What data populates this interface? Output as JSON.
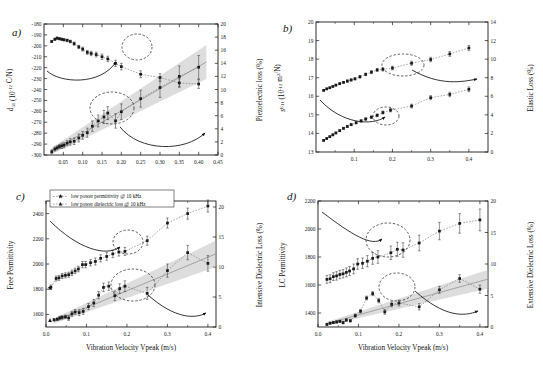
{
  "figure": {
    "background": "#ffffff",
    "foreground": "#1a1a1a",
    "band_color": "#b4b4b4",
    "fit_color": "#8a8a8a"
  },
  "panels": [
    {
      "id": "a",
      "label": "a)",
      "xlabel": "",
      "ylabel_left": "d31 (10-12 C/N)",
      "ylabel_right": "Piezoelectric loss (%)",
      "xticks": [
        "0.05",
        "0.10",
        "0.15",
        "0.20",
        "0.25",
        "0.30",
        "0.35",
        "0.40",
        "0.45"
      ],
      "yticks_left": [
        "-300",
        "-290",
        "-280",
        "-270",
        "-260",
        "-250",
        "-240",
        "-230",
        "-220",
        "-210",
        "-200",
        "-190",
        "-180"
      ],
      "yticks_right": [
        "0",
        "2",
        "4",
        "6",
        "8",
        "10",
        "12",
        "14",
        "16",
        "18",
        "20"
      ]
    },
    {
      "id": "b",
      "label": "b)",
      "xlabel": "",
      "ylabel_left": "sE11 (10-12 m2/N)",
      "ylabel_right": "Elastic Loss (%)",
      "xticks": [
        "0.1",
        "0.2",
        "0.3",
        "0.4"
      ],
      "yticks_left": [
        "13",
        "14",
        "15",
        "16",
        "17",
        "18",
        "19",
        "20"
      ],
      "yticks_right": [
        "0",
        "2",
        "4",
        "6",
        "8",
        "10",
        "12",
        "14"
      ]
    },
    {
      "id": "c",
      "label": "c)",
      "xlabel": "Vibration Velocity Vpeak (m/s)",
      "ylabel_left": "Free Permittivity",
      "ylabel_right": "Intensive Dielectric Loss (%)",
      "xticks": [
        "0.0",
        "0.1",
        "0.2",
        "0.3",
        "0.4"
      ],
      "yticks_left": [
        "1600",
        "1800",
        "2000",
        "2200",
        "2400"
      ],
      "yticks_right": [
        "0",
        "5",
        "10",
        "15",
        "20"
      ],
      "legend": [
        {
          "marker": "star",
          "text": "low power permittivity @ 10 kHz"
        },
        {
          "marker": "triangle",
          "text": "low power dielectric loss @ 10 kHz"
        }
      ]
    },
    {
      "id": "d",
      "label": "d)",
      "xlabel": "Vibration Velocity Vpeak (m/s)",
      "ylabel_left": "LC Permittivity",
      "ylabel_right": "Extensive Dielectric Loss (%)",
      "xticks": [
        "0.0",
        "0.1",
        "0.2",
        "0.3",
        "0.4"
      ],
      "yticks_left": [
        "1400",
        "1600",
        "1800",
        "2000",
        "2200"
      ],
      "yticks_right": [
        "0",
        "5",
        "10",
        "15",
        "20"
      ]
    }
  ],
  "chart_data": [
    {
      "type": "scatter",
      "panel": "a",
      "title": "",
      "xlabel": "Vibration Velocity Vpeak (m/s)",
      "ylabel": "d31 (10-12 C/N)",
      "ylabel_right": "Piezoelectric loss (%)",
      "xlim": [
        0.0,
        0.45
      ],
      "ylim": [
        -300,
        -180
      ],
      "ylim_right": [
        0,
        20
      ],
      "grid": false,
      "series": [
        {
          "name": "d31",
          "axis": "left",
          "marker": "square",
          "x": [
            0.02,
            0.028,
            0.034,
            0.04,
            0.046,
            0.052,
            0.06,
            0.068,
            0.078,
            0.09,
            0.1,
            0.112,
            0.122,
            0.135,
            0.15,
            0.165,
            0.185,
            0.2,
            0.25,
            0.3,
            0.35,
            0.4
          ],
          "y": [
            -196,
            -194,
            -193,
            -193.5,
            -194,
            -194.5,
            -195,
            -196,
            -198,
            -201,
            -203,
            -206,
            -207,
            -208,
            -210,
            -212,
            -216,
            -219,
            -226,
            -229,
            -234,
            -235
          ],
          "yerr": [
            1.0,
            1.0,
            1.0,
            1.0,
            1.0,
            1.0,
            1.2,
            1.2,
            1.5,
            1.5,
            1.8,
            1.8,
            2.0,
            2.2,
            2.5,
            2.5,
            2.8,
            3.0,
            3.2,
            3.5,
            3.8,
            4.0
          ]
        },
        {
          "name": "Piezoelectric loss",
          "axis": "right",
          "marker": "square",
          "x": [
            0.02,
            0.028,
            0.034,
            0.04,
            0.046,
            0.052,
            0.06,
            0.068,
            0.078,
            0.09,
            0.1,
            0.112,
            0.125,
            0.14,
            0.155,
            0.165,
            0.185,
            0.2,
            0.25,
            0.3,
            0.35,
            0.4
          ],
          "y": [
            0.5,
            0.9,
            1.1,
            1.3,
            1.4,
            1.5,
            1.8,
            2.0,
            2.1,
            2.6,
            3.0,
            3.4,
            4.4,
            5.2,
            5.8,
            6.4,
            5.2,
            6.6,
            8.6,
            10.3,
            12.0,
            13.4
          ],
          "yerr": [
            0.3,
            0.3,
            0.3,
            0.3,
            0.4,
            0.4,
            0.4,
            0.5,
            0.5,
            0.6,
            0.6,
            0.7,
            0.8,
            0.9,
            1.0,
            1.0,
            1.1,
            1.2,
            1.3,
            1.5,
            1.6,
            1.8
          ]
        }
      ],
      "fit_band": {
        "on": "right",
        "x": [
          0.02,
          0.42
        ],
        "y": [
          0.6,
          14.2
        ],
        "width": [
          0.5,
          2.6
        ]
      }
    },
    {
      "type": "scatter",
      "panel": "b",
      "title": "",
      "xlabel": "Vibration Velocity Vpeak (m/s)",
      "ylabel": "sE11 (10-12 m2/N)",
      "ylabel_right": "Elastic Loss (%)",
      "xlim": [
        0.0,
        0.45
      ],
      "ylim": [
        13,
        20
      ],
      "ylim_right": [
        0,
        14
      ],
      "grid": false,
      "series": [
        {
          "name": "sE11",
          "axis": "left",
          "marker": "square",
          "x": [
            0.02,
            0.028,
            0.036,
            0.044,
            0.052,
            0.062,
            0.072,
            0.082,
            0.092,
            0.102,
            0.115,
            0.13,
            0.145,
            0.16,
            0.175,
            0.2,
            0.25,
            0.3,
            0.35,
            0.4
          ],
          "y": [
            16.32,
            16.4,
            16.46,
            16.53,
            16.6,
            16.68,
            16.75,
            16.82,
            16.88,
            16.94,
            17.05,
            17.18,
            17.3,
            17.42,
            17.45,
            17.52,
            17.78,
            17.98,
            18.28,
            18.6
          ],
          "yerr": [
            0.04,
            0.04,
            0.04,
            0.04,
            0.05,
            0.05,
            0.05,
            0.06,
            0.06,
            0.06,
            0.07,
            0.07,
            0.08,
            0.08,
            0.09,
            0.1,
            0.11,
            0.12,
            0.13,
            0.14
          ]
        },
        {
          "name": "Elastic Loss",
          "axis": "right",
          "marker": "square",
          "x": [
            0.02,
            0.028,
            0.036,
            0.044,
            0.052,
            0.062,
            0.072,
            0.082,
            0.092,
            0.105,
            0.118,
            0.13,
            0.145,
            0.16,
            0.175,
            0.195,
            0.25,
            0.3,
            0.35,
            0.4
          ],
          "y": [
            1.25,
            1.45,
            1.65,
            1.85,
            2.05,
            2.3,
            2.55,
            2.75,
            2.95,
            3.15,
            3.35,
            3.55,
            3.75,
            3.95,
            4.25,
            4.5,
            4.95,
            5.85,
            6.2,
            6.75
          ],
          "yerr": [
            0.08,
            0.08,
            0.08,
            0.09,
            0.09,
            0.1,
            0.1,
            0.11,
            0.11,
            0.12,
            0.13,
            0.13,
            0.14,
            0.15,
            0.16,
            0.18,
            0.2,
            0.22,
            0.24,
            0.26
          ]
        }
      ]
    },
    {
      "type": "scatter",
      "panel": "c",
      "title": "",
      "xlabel": "Vibration Velocity Vpeak (m/s)",
      "ylabel": "Free Permittivity",
      "ylabel_right": "Intensive Dielectric Loss (%)",
      "xlim": [
        0.0,
        0.42
      ],
      "ylim": [
        1500,
        2500
      ],
      "ylim_right": [
        0,
        21
      ],
      "grid": false,
      "series": [
        {
          "name": "Free Permittivity",
          "axis": "left",
          "marker": "square",
          "x": [
            0.012,
            0.025,
            0.032,
            0.04,
            0.048,
            0.056,
            0.064,
            0.072,
            0.08,
            0.09,
            0.098,
            0.11,
            0.122,
            0.135,
            0.15,
            0.165,
            0.18,
            0.195,
            0.25,
            0.3,
            0.35,
            0.4
          ],
          "y": [
            1815,
            1885,
            1890,
            1905,
            1910,
            1915,
            1930,
            1945,
            1960,
            1995,
            1995,
            2010,
            2020,
            2045,
            2060,
            2080,
            2095,
            2100,
            2185,
            2325,
            2400,
            2460
          ],
          "yerr": [
            18,
            20,
            20,
            20,
            20,
            20,
            22,
            22,
            22,
            25,
            25,
            25,
            28,
            28,
            30,
            30,
            32,
            32,
            36,
            40,
            44,
            48
          ]
        },
        {
          "name": "Intensive Dielectric Loss",
          "axis": "right",
          "marker": "square",
          "x": [
            0.02,
            0.028,
            0.034,
            0.04,
            0.048,
            0.056,
            0.064,
            0.072,
            0.082,
            0.092,
            0.105,
            0.118,
            0.13,
            0.142,
            0.155,
            0.17,
            0.182,
            0.195,
            0.25,
            0.3,
            0.35,
            0.4
          ],
          "y": [
            1.2,
            1.3,
            1.5,
            1.6,
            1.7,
            1.5,
            2.2,
            2.5,
            2.4,
            2.6,
            3.4,
            4.0,
            5.3,
            6.6,
            6.8,
            5.2,
            6.4,
            6.8,
            5.6,
            9.4,
            12.4,
            10.6
          ],
          "yerr": [
            0.2,
            0.2,
            0.3,
            0.3,
            0.3,
            0.4,
            0.4,
            0.4,
            0.5,
            0.5,
            0.5,
            0.6,
            0.6,
            0.7,
            0.7,
            0.8,
            0.8,
            0.9,
            1.0,
            1.1,
            1.2,
            1.3
          ]
        },
        {
          "name": "low power permittivity @ 10 kHz",
          "axis": "left",
          "marker": "star",
          "x": [
            0.01
          ],
          "y": [
            1810
          ]
        },
        {
          "name": "low power dielectric loss @ 10 kHz",
          "axis": "right",
          "marker": "triangle",
          "x": [
            0.01
          ],
          "y": [
            1.1
          ]
        }
      ],
      "fit_band": {
        "on": "right",
        "x": [
          0.02,
          0.42
        ],
        "y": [
          1.0,
          12.2
        ],
        "width": [
          0.4,
          2.2
        ]
      }
    },
    {
      "type": "scatter",
      "panel": "d",
      "title": "",
      "xlabel": "Vibration Velocity Vpeak (m/s)",
      "ylabel": "LC Permittivity",
      "ylabel_right": "Extensive Dielectric Loss (%)",
      "xlim": [
        0.0,
        0.42
      ],
      "ylim": [
        1300,
        2200
      ],
      "ylim_right": [
        0,
        20
      ],
      "grid": false,
      "series": [
        {
          "name": "LC Permittivity",
          "axis": "left",
          "marker": "square",
          "x": [
            0.022,
            0.03,
            0.038,
            0.046,
            0.054,
            0.062,
            0.07,
            0.078,
            0.088,
            0.098,
            0.11,
            0.122,
            0.135,
            0.148,
            0.18,
            0.196,
            0.21,
            0.25,
            0.3,
            0.35,
            0.4
          ],
          "y": [
            1640,
            1645,
            1660,
            1665,
            1675,
            1680,
            1690,
            1700,
            1715,
            1750,
            1755,
            1770,
            1790,
            1800,
            1830,
            1855,
            1850,
            1900,
            1985,
            2040,
            2065
          ],
          "yerr": [
            28,
            28,
            28,
            30,
            30,
            30,
            32,
            32,
            35,
            38,
            38,
            40,
            42,
            45,
            48,
            50,
            52,
            56,
            62,
            70,
            78
          ]
        },
        {
          "name": "Extensive Dielectric Loss",
          "axis": "right",
          "marker": "square",
          "x": [
            0.022,
            0.03,
            0.038,
            0.046,
            0.054,
            0.062,
            0.07,
            0.08,
            0.092,
            0.105,
            0.12,
            0.135,
            0.15,
            0.165,
            0.182,
            0.2,
            0.25,
            0.3,
            0.35,
            0.4
          ],
          "y": [
            0.4,
            0.6,
            0.7,
            0.8,
            0.9,
            0.7,
            1.1,
            1.0,
            1.8,
            2.5,
            4.6,
            5.3,
            4.2,
            2.4,
            3.6,
            3.8,
            3.2,
            5.9,
            7.7,
            6.0
          ],
          "yerr": [
            0.15,
            0.15,
            0.15,
            0.18,
            0.18,
            0.2,
            0.2,
            0.22,
            0.25,
            0.28,
            0.3,
            0.32,
            0.35,
            0.38,
            0.4,
            0.45,
            0.5,
            0.55,
            0.6,
            0.65
          ]
        }
      ],
      "fit_band": {
        "on": "right",
        "x": [
          0.02,
          0.42
        ],
        "y": [
          0.5,
          7.6
        ],
        "width": [
          0.25,
          1.5
        ]
      }
    }
  ]
}
